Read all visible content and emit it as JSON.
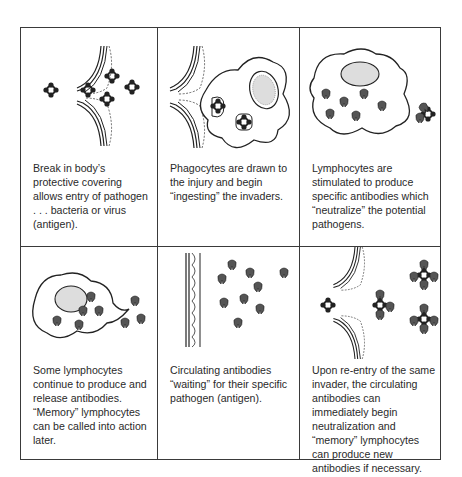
{
  "panels": [
    {
      "id": "break",
      "caption": "Break in body’s protective covering allows entry of pathogen . . . bacteria or virus (antigen)."
    },
    {
      "id": "phagocytes",
      "caption": "Phagocytes are drawn to the injury and begin “ingesting” the invaders."
    },
    {
      "id": "lymphocytes",
      "caption": "Lymphocytes are stimulated to produce specific antibodies which “neutralize” the potential pathogens."
    },
    {
      "id": "memory",
      "caption": "Some lymphocytes continue to produce and release antibodies. “Memory” lymphocytes can be called into action later."
    },
    {
      "id": "circulating",
      "caption": "Circulating antibodies “waiting” for their specific pathogen (antigen)."
    },
    {
      "id": "reentry",
      "caption": "Upon re-entry of the same invader, the circulating antibodies can immediately begin neutralization and “memory” lymphocytes can produce new antibodies if necessary."
    }
  ],
  "colors": {
    "line": "#3a3a3a",
    "ink": "#2a2a2a",
    "antibody": "#555555"
  }
}
